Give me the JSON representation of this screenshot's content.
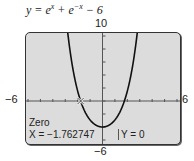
{
  "chart_data": {
    "type": "line",
    "title_parts": {
      "y": "y = e",
      "exp1": "x",
      "mid": " + e",
      "exp2": "−x",
      "tail": " − 6"
    },
    "xlim": [
      -6,
      6
    ],
    "ylim": [
      -6,
      10
    ],
    "xscl": 1,
    "yscl": 2,
    "axis_labels": {
      "xmin": "−6",
      "xmax": "6",
      "ymax": "10",
      "ymin": "−6"
    },
    "series": [
      {
        "name": "y = e^x + e^-x - 6",
        "function": "exp(x)+exp(-x)-6",
        "color": "#111111"
      }
    ],
    "trace": {
      "mode": "Zero",
      "x": -1.762747,
      "y": 0,
      "x_label": "X = −1.762747",
      "y_label": "Y = 0"
    },
    "grid": false
  },
  "colors": {
    "screen_bg": "#dcdcdc",
    "curve": "#111111",
    "axis": "#555555"
  }
}
